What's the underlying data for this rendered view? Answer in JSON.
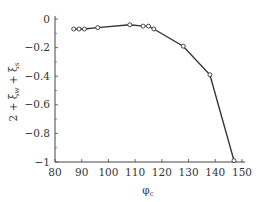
{
  "chart_data": {
    "type": "line",
    "title": "",
    "xlabel": "φ_c",
    "ylabel": "2 + ξ_w + ξ_s",
    "xlim": [
      80,
      150
    ],
    "ylim": [
      -1,
      0
    ],
    "grid": false,
    "legend": null,
    "x_ticks": [
      80,
      90,
      100,
      110,
      120,
      130,
      140,
      150
    ],
    "y_ticks": [
      0,
      -0.2,
      -0.4,
      -0.6,
      -0.8,
      -1
    ],
    "y_tick_labels": [
      "0",
      "−0.2",
      "−0.4",
      "−0.6",
      "−0.8",
      "−1"
    ],
    "series": [
      {
        "name": "2 + ξw + ξs",
        "marker": "open-circle",
        "color": "#333333",
        "x": [
          87,
          89,
          91,
          96,
          108,
          113,
          115,
          117,
          128,
          138,
          147
        ],
        "y": [
          -0.07,
          -0.07,
          -0.07,
          -0.06,
          -0.04,
          -0.05,
          -0.05,
          -0.07,
          -0.19,
          -0.39,
          -0.99
        ]
      }
    ]
  }
}
